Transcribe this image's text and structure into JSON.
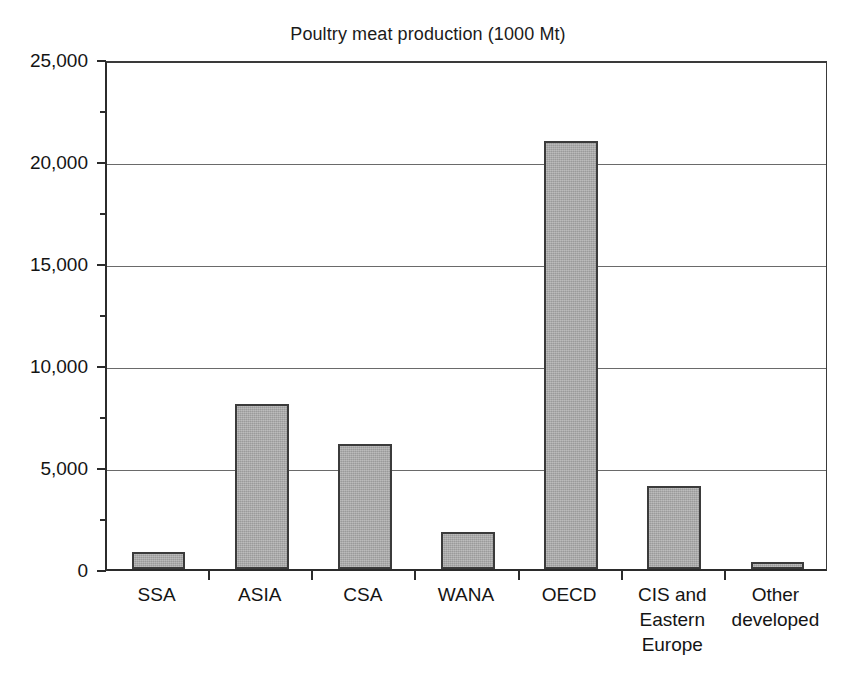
{
  "chart_data": {
    "type": "bar",
    "title": "Poultry meat production (1000 Mt)",
    "xlabel": "",
    "ylabel": "",
    "ylim": [
      0,
      25000
    ],
    "ytick_values": [
      0,
      5000,
      10000,
      15000,
      20000,
      25000
    ],
    "ytick_labels": [
      "0",
      "5,000",
      "10,000",
      "15,000",
      "20,000",
      "25,000"
    ],
    "grid": true,
    "grid_axis": "y",
    "legend": false,
    "categories": [
      "SSA",
      "ASIA",
      "CSA",
      "WANA",
      "OECD",
      "CIS and Eastern Europe",
      "Other developed"
    ],
    "category_label_lines": [
      [
        "SSA"
      ],
      [
        "ASIA"
      ],
      [
        "CSA"
      ],
      [
        "WANA"
      ],
      [
        "OECD"
      ],
      [
        "CIS and",
        "Eastern",
        "Europe"
      ],
      [
        "Other",
        "developed"
      ]
    ],
    "values": [
      850,
      8100,
      6150,
      1800,
      21000,
      4050,
      350
    ],
    "series": [
      {
        "name": "Poultry meat production",
        "values": [
          850,
          8100,
          6150,
          1800,
          21000,
          4050,
          350
        ]
      }
    ],
    "colors": {
      "bar_fill": "#a9a9a9",
      "bar_border": "#3b3b3b",
      "gridline": "#6a6a6a",
      "axis": "#2b2b2b",
      "text": "#141414",
      "background": "#ffffff"
    }
  }
}
